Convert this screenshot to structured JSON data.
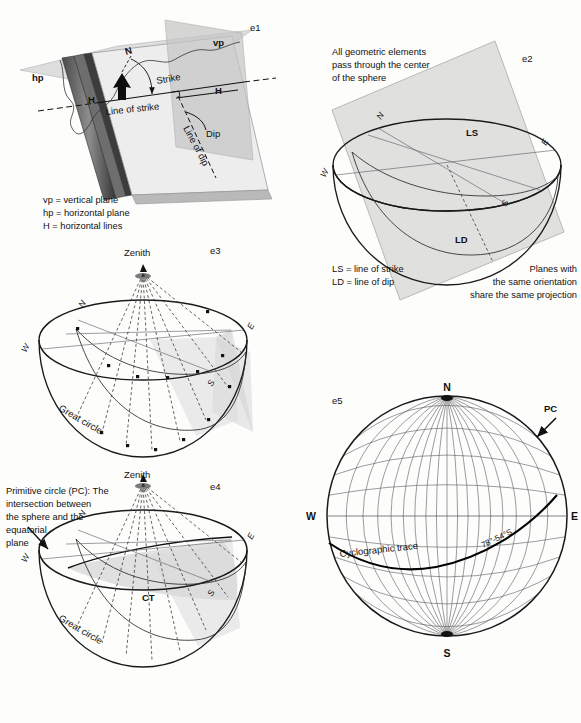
{
  "figure": {
    "background_color": "#fdfdfc",
    "ink_color": "#111111",
    "panel_ids": [
      "e1",
      "e2",
      "e3",
      "e4",
      "e5"
    ]
  },
  "panels": {
    "e1": {
      "id": "e1",
      "labels": {
        "vertical_plane": "vp",
        "horizontal_plane": "hp",
        "north_arrow": "N",
        "strike": "Strike",
        "line_of_strike": "Line of strike",
        "dip": "Dip",
        "line_of_dip": "Line of dip",
        "horizontal_line_left": "H",
        "horizontal_line_right": "H"
      },
      "legend": [
        "vp = vertical plane",
        "hp = horizontal plane",
        "H = horizontal lines"
      ]
    },
    "e2": {
      "id": "e2",
      "caption_top": [
        "All geometric elements",
        "pass through the center",
        "of the sphere"
      ],
      "caption_bottom_right": [
        "Planes with",
        "the same orientation",
        "share the same projection"
      ],
      "legend": [
        "LS = line of strike",
        "LD = line of dip"
      ],
      "labels": {
        "line_of_strike": "LS",
        "line_of_dip": "LD"
      },
      "compass": {
        "n": "N",
        "e": "E",
        "s": "S",
        "w": "W"
      }
    },
    "e3": {
      "id": "e3",
      "labels": {
        "zenith": "Zenith",
        "great_circle": "Great circle"
      },
      "compass": {
        "n": "N",
        "e": "E",
        "s": "S",
        "w": "W"
      }
    },
    "e4": {
      "id": "e4",
      "caption": [
        "Primitive circle (PC): The",
        "intersection between",
        "the sphere and the",
        "equatorial",
        "plane"
      ],
      "labels": {
        "zenith": "Zenith",
        "great_circle": "Great circle",
        "cyclographic_trace": "CT"
      },
      "compass": {
        "n": "N",
        "e": "E",
        "s": "S",
        "w": "W"
      }
    },
    "e5": {
      "id": "e5",
      "labels": {
        "primitive_circle": "PC",
        "cyclographic_trace": "Cyclographic trace",
        "orientation": "78°-54°S"
      },
      "compass": {
        "n": "N",
        "e": "E",
        "s": "S",
        "w": "W"
      },
      "stereonet": {
        "type": "equal-angle (Wulff) net",
        "grid_spacing_degrees": 10,
        "radius_px": 120,
        "center_px": [
          447,
          516
        ],
        "plane_strike_degrees": 78,
        "plane_dip_degrees": 54,
        "dip_direction": "S"
      }
    }
  },
  "chart_data": {
    "type": "scatter",
    "xlabel": "",
    "ylabel": "",
    "net_type": "equal-angle",
    "grid": true,
    "grid_spacing_degrees": 10,
    "cardinal_points": [
      "N",
      "E",
      "S",
      "W"
    ],
    "annotations": [
      "PC",
      "Cyclographic trace",
      "78°-54°S"
    ],
    "series": [
      {
        "name": "plane",
        "strike_degrees": 78,
        "dip_degrees": 54,
        "dip_quadrant": "S"
      }
    ]
  }
}
